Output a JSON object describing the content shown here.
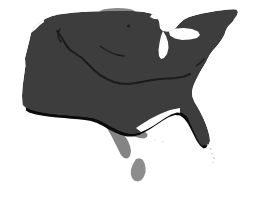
{
  "image": {
    "subject": "Map of the contiguous United States",
    "style": "grayscale silhouette with drop shadow",
    "width": 256,
    "height": 197
  },
  "canvas": {
    "background_color": "#ffffff"
  },
  "colors": {
    "background": "#ffffff",
    "landmass_fill": "#3d3d3d",
    "shadow": "#0b0b0b",
    "highlight_north": "#8a8a8a",
    "neighbor_south": "#848484",
    "island_fill": "#8d8d8d",
    "lake_fill": "#ffffff",
    "interior_line": "#1c1c1c",
    "faint_speck": "#cfcfcf"
  },
  "regions": [
    {
      "name": "contiguous-united-states",
      "label": "Contiguous United States",
      "fill_key": "landmass_fill",
      "role": "primary-landmass"
    },
    {
      "name": "northern-highlight",
      "label": "Northern highlighted area",
      "fill_key": "highlight_north",
      "role": "highlighted-region"
    },
    {
      "name": "southern-neighbor",
      "label": "Southern neighbouring landmass",
      "fill_key": "neighbor_south",
      "role": "adjacent-landmass"
    },
    {
      "name": "baja-peninsula",
      "label": "Southern peninsula",
      "fill_key": "island_fill",
      "role": "adjacent-landmass"
    },
    {
      "name": "great-lakes",
      "label": "Great Lakes",
      "fill_key": "lake_fill",
      "role": "water-body"
    },
    {
      "name": "drop-shadow",
      "label": "Drop shadow",
      "fill_key": "shadow",
      "role": "decoration"
    }
  ],
  "geometry": {
    "shadow_path": "M28 112 L24 100 L26 82 L30 70 L32 54 L44 44 L58 30 L62 23 L76 22 L86 26 L100 25 L118 26 L136 24 L154 24 L166 28 L176 36 L186 34 L196 28 L206 24 L216 22 L226 20 L236 20 L240 26 L234 34 L230 44 L224 52 L216 60 L212 70 L206 80 L200 90 L196 100 L200 110 L206 120 L212 132 L216 142 L212 150 L204 146 L198 136 L192 124 L184 118 L172 124 L160 132 L148 138 L138 140 L126 138 L116 134 L106 128 L96 124 L86 122 L74 120 L62 118 L48 116 Z",
    "main_path": "M26 110 L22 98 L24 80 L28 68 L30 52 L42 42 L56 28 L60 21 L74 20 L84 24 L98 23 L116 24 L134 22 L152 22 L164 26 L174 34 L184 32 L194 26 L204 22 L214 20 L224 18 L234 18 L238 24 L232 32 L228 42 L222 50 L214 58 L210 68 L204 78 L198 88 L194 98 L198 108 L204 118 L210 130 L214 140 L210 148 L202 144 L196 134 L190 122 L182 116 L170 122 L158 130 L146 136 L136 138 L124 136 L114 132 L104 126 L94 122 L84 120 L72 118 L60 116 L46 114 Z",
    "viewbox": "0 0 256 197"
  },
  "annotations": {
    "has_text_labels": false,
    "has_legend": false,
    "has_axes": false,
    "has_scale_bar": false
  }
}
